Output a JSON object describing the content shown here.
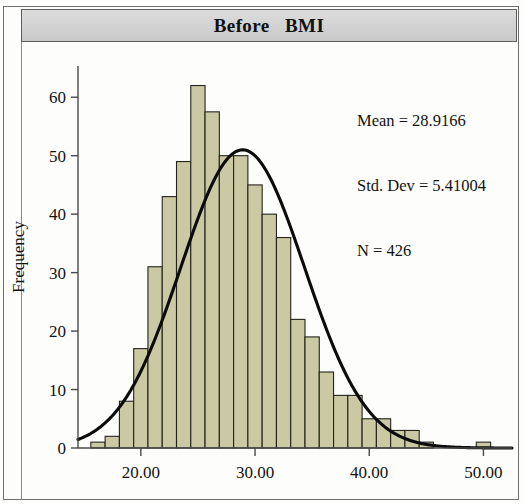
{
  "figure": {
    "title": "Before   BMI",
    "panel_background": "#fdfdfb",
    "header_background": "#d3d3d3",
    "bar_fill": "#cbc8a4",
    "bar_stroke": "#23231c",
    "curve_color": "#0b0b0b"
  },
  "stats": {
    "mean_label": "Mean = 28.9166",
    "std_dev_label": "Std. Dev = 5.41004",
    "n_label": "N = 426"
  },
  "axes": {
    "y_title": "Frequency",
    "x_title": "",
    "y_ticks": [
      "0",
      "10",
      "20",
      "30",
      "40",
      "50",
      "60"
    ],
    "x_ticks": [
      "20.00",
      "30.00",
      "40.00",
      "50.00"
    ]
  },
  "chart_data": {
    "type": "bar",
    "title": "Before   BMI",
    "xlabel": "",
    "ylabel": "Frequency",
    "xlim": [
      14.5,
      52.5
    ],
    "ylim": [
      0,
      65
    ],
    "ytick_values": [
      0,
      10,
      20,
      30,
      40,
      50,
      60
    ],
    "xtick_values": [
      20,
      30,
      40,
      50
    ],
    "grid": false,
    "legend": "none",
    "bin_width": 1.25,
    "annotations": [
      "Mean = 28.9166",
      "Std. Dev = 5.41004",
      "N = 426"
    ],
    "bin_centers": [
      16.25,
      17.5,
      18.75,
      20.0,
      21.25,
      22.5,
      23.75,
      25.0,
      26.25,
      27.5,
      28.75,
      30.0,
      31.25,
      32.5,
      33.75,
      35.0,
      36.25,
      37.5,
      38.75,
      40.0,
      41.25,
      42.5,
      43.75,
      45.0,
      46.25,
      47.5,
      50.0
    ],
    "values": [
      1,
      2,
      8,
      17,
      31,
      43,
      49,
      62,
      57.5,
      50,
      50,
      45,
      40,
      36,
      22,
      19,
      13,
      9,
      9,
      5,
      5,
      3,
      3,
      1,
      0,
      0,
      1
    ],
    "categories": [
      "16.25",
      "17.50",
      "18.75",
      "20.00",
      "21.25",
      "22.50",
      "23.75",
      "25.00",
      "26.25",
      "27.50",
      "28.75",
      "30.00",
      "31.25",
      "32.50",
      "33.75",
      "35.00",
      "36.25",
      "37.50",
      "38.75",
      "40.00",
      "41.25",
      "42.50",
      "43.75",
      "45.00",
      "46.25",
      "47.50",
      "50.00"
    ],
    "normal_curve": {
      "mean": 28.9166,
      "std_dev": 5.41004,
      "n": 426,
      "peak_value": 51
    }
  }
}
